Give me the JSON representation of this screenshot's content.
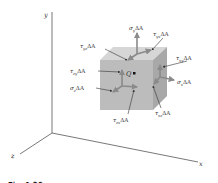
{
  "figure": {
    "axes": {
      "x": "x",
      "y": "y",
      "z": "z"
    },
    "point_label": "Q",
    "cube": {
      "front_color": "#b9b9b9",
      "top_color": "#d6d6d6",
      "side_color": "#a6a6a6",
      "arrow_color": "#7f7f7f"
    },
    "labels": {
      "sigma_y": "σ",
      "sigma_y_sub": "y",
      "tau_yx": "τ",
      "tau_yx_sub": "yx",
      "tau_yz": "τ",
      "tau_yz_sub": "yz",
      "tau_xy": "τ",
      "tau_xy_sub": "xy",
      "tau_zy": "τ",
      "tau_zy_sub": "zy",
      "sigma_x": "σ",
      "sigma_x_sub": "x",
      "sigma_z": "σ",
      "sigma_z_sub": "z",
      "tau_zx": "τ",
      "tau_zx_sub": "zx",
      "tau_xz": "τ",
      "tau_xz_sub": "xz",
      "delta_a": "ΔA"
    },
    "caption": "Fig. 1.36"
  }
}
